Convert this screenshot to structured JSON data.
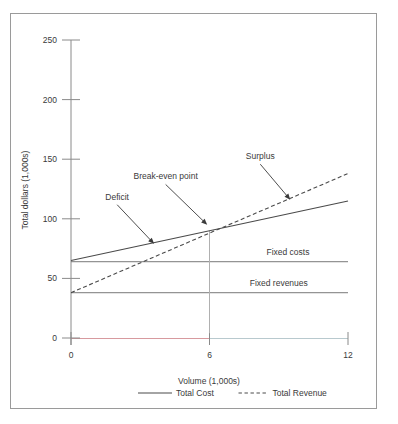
{
  "chart_data": {
    "type": "line",
    "title": "",
    "xlabel": "Volume (1,000s)",
    "ylabel": "Total dollars (1,000s)",
    "xlim": [
      0,
      12
    ],
    "ylim": [
      0,
      250
    ],
    "xticks": [
      "0",
      "6",
      "12"
    ],
    "xtick_values": [
      0,
      6,
      12
    ],
    "yticks": [
      "0",
      "50",
      "100",
      "150",
      "200",
      "250"
    ],
    "ytick_values": [
      0,
      50,
      100,
      150,
      200,
      250
    ],
    "grid": false,
    "legend_position": "bottom",
    "series": [
      {
        "name": "Total Cost",
        "style": "solid",
        "color": "#4a4a4a",
        "x": [
          0,
          12
        ],
        "values": [
          65,
          115
        ]
      },
      {
        "name": "Total Revenue",
        "style": "dashed",
        "color": "#4a4a4a",
        "x": [
          0,
          12
        ],
        "values": [
          38,
          138
        ]
      },
      {
        "name": "Fixed costs",
        "style": "solid",
        "color": "#6a6a6a",
        "x": [
          0,
          12
        ],
        "values": [
          64,
          64
        ]
      },
      {
        "name": "Fixed revenues",
        "style": "solid",
        "color": "#6a6a6a",
        "x": [
          0,
          12
        ],
        "values": [
          38,
          38
        ]
      }
    ],
    "annotations": [
      {
        "text": "Deficit",
        "label_x": 2.0,
        "label_y": 116,
        "point_x": 3.6,
        "point_y": 79
      },
      {
        "text": "Break-even point",
        "label_x": 4.1,
        "label_y": 133,
        "point_x": 5.9,
        "point_y": 95
      },
      {
        "text": "Surplus",
        "label_x": 8.2,
        "label_y": 150,
        "point_x": 9.5,
        "point_y": 116
      }
    ],
    "inline_labels": [
      {
        "text": "Fixed costs",
        "x": 9.4,
        "y": 70
      },
      {
        "text": "Fixed revenues",
        "x": 9.0,
        "y": 44
      }
    ],
    "breakeven": {
      "x": 6,
      "y": 90
    }
  },
  "legend": {
    "items": [
      {
        "label": "Total Cost",
        "style": "solid"
      },
      {
        "label": "Total Revenue",
        "style": "dashed"
      }
    ]
  },
  "axes": {
    "x_title": "Volume (1,000s)",
    "y_title": "Total dollars (1,000s)"
  }
}
